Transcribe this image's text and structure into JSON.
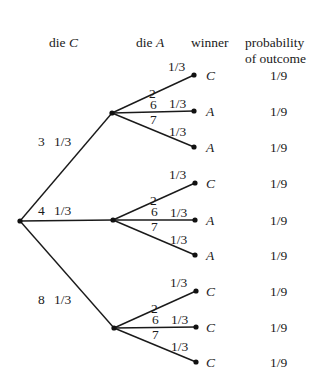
{
  "headers": {
    "die_c_prefix": "die ",
    "die_c_var": "C",
    "die_a_prefix": "die ",
    "die_a_var": "A",
    "winner": "winner",
    "probability_line1": "probability",
    "probability_line2": "of outcome"
  },
  "root": {
    "x": 20,
    "y": 221
  },
  "level1": [
    {
      "x": 112,
      "y": 113,
      "value": "3",
      "prob": "1/3",
      "label_x": 38,
      "label_y": 146
    },
    {
      "x": 113,
      "y": 220,
      "value": "4",
      "prob": "1/3",
      "label_x": 38,
      "label_y": 215
    },
    {
      "x": 114,
      "y": 328,
      "value": "8",
      "prob": "1/3",
      "label_x": 38,
      "label_y": 304
    }
  ],
  "leaves": [
    {
      "parent": 0,
      "x": 194,
      "y": 75,
      "value": "2",
      "prob": "1/3",
      "winner": "C",
      "outcome_prob": "1/9"
    },
    {
      "parent": 0,
      "x": 194,
      "y": 111,
      "value": "6",
      "prob": "1/3",
      "winner": "A",
      "outcome_prob": "1/9"
    },
    {
      "parent": 0,
      "x": 194,
      "y": 147,
      "value": "7",
      "prob": "1/3",
      "winner": "A",
      "outcome_prob": "1/9"
    },
    {
      "parent": 1,
      "x": 195,
      "y": 183,
      "value": "2",
      "prob": "1/3",
      "winner": "C",
      "outcome_prob": "1/9"
    },
    {
      "parent": 1,
      "x": 195,
      "y": 220,
      "value": "6",
      "prob": "1/3",
      "winner": "A",
      "outcome_prob": "1/9"
    },
    {
      "parent": 1,
      "x": 195,
      "y": 255,
      "value": "7",
      "prob": "1/3",
      "winner": "A",
      "outcome_prob": "1/9"
    },
    {
      "parent": 2,
      "x": 196,
      "y": 291,
      "value": "2",
      "prob": "1/3",
      "winner": "C",
      "outcome_prob": "1/9"
    },
    {
      "parent": 2,
      "x": 196,
      "y": 327,
      "value": "6",
      "prob": "1/3",
      "winner": "C",
      "outcome_prob": "1/9"
    },
    {
      "parent": 2,
      "x": 196,
      "y": 362,
      "value": "7",
      "prob": "1/3",
      "winner": "C",
      "outcome_prob": "1/9"
    }
  ]
}
